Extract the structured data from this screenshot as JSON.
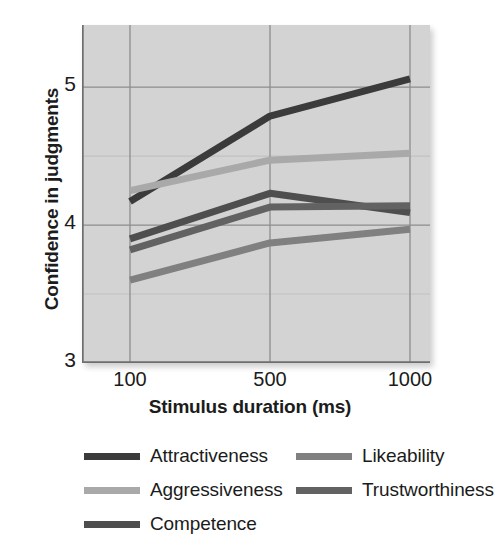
{
  "chart_data": {
    "type": "line",
    "title": "",
    "xlabel": "Stimulus duration (ms)",
    "ylabel": "Confidence in judgments",
    "categories": [
      "100",
      "500",
      "1000"
    ],
    "x_numeric": [
      100,
      500,
      1000
    ],
    "xtick_labels": [
      "100",
      "500",
      "1000"
    ],
    "ytick_labels": [
      "3",
      "4",
      "5"
    ],
    "ytick_values": [
      3,
      4,
      5
    ],
    "ylim": [
      3,
      5.45
    ],
    "grid": true,
    "grid_y_minor": [
      3.5,
      4.5
    ],
    "legend_position": "below",
    "plot_background": "#d3d3d3",
    "series": [
      {
        "name": "Attractiveness",
        "color": "#3b3b3b",
        "values": [
          4.17,
          4.79,
          5.06
        ]
      },
      {
        "name": "Aggressiveness",
        "color": "#a9a9a9",
        "values": [
          4.25,
          4.47,
          4.52
        ]
      },
      {
        "name": "Competence",
        "color": "#4e4e4e",
        "values": [
          3.9,
          4.23,
          4.09
        ]
      },
      {
        "name": "Likeability",
        "color": "#808080",
        "values": [
          3.6,
          3.87,
          3.97
        ]
      },
      {
        "name": "Trustworthiness",
        "color": "#626262",
        "values": [
          3.82,
          4.13,
          4.14
        ]
      }
    ]
  },
  "legend": {
    "entries": [
      {
        "label": "Attractiveness",
        "color": "#3b3b3b",
        "col": 0,
        "row": 0
      },
      {
        "label": "Aggressiveness",
        "color": "#a9a9a9",
        "col": 0,
        "row": 1
      },
      {
        "label": "Competence",
        "color": "#4e4e4e",
        "col": 0,
        "row": 2
      },
      {
        "label": "Likeability",
        "color": "#808080",
        "col": 1,
        "row": 0
      },
      {
        "label": "Trustworthiness",
        "color": "#626262",
        "col": 1,
        "row": 1
      }
    ]
  }
}
